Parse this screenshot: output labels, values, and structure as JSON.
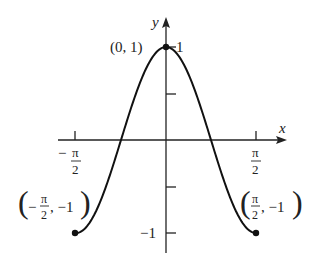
{
  "chart_data": {
    "type": "line",
    "title": "",
    "function": "y = cos(2x)",
    "xlabel": "x",
    "ylabel": "y",
    "xlim": [
      -1.5708,
      1.5708
    ],
    "ylim": [
      -1,
      1
    ],
    "grid": false,
    "x_ticks": [
      {
        "value": -1.5708,
        "label_num": "π",
        "label_den": "2",
        "sign": "−"
      },
      {
        "value": 1.5708,
        "label_num": "π",
        "label_den": "2",
        "sign": ""
      }
    ],
    "y_ticks": [
      {
        "value": 1,
        "label": "1"
      },
      {
        "value": 0.5,
        "label": ""
      },
      {
        "value": -0.5,
        "label": ""
      },
      {
        "value": -1,
        "label": "−1"
      }
    ],
    "series": [
      {
        "name": "cos(2x)",
        "x": [
          -1.5708,
          -1.1781,
          -0.7854,
          -0.3927,
          0,
          0.3927,
          0.7854,
          1.1781,
          1.5708
        ],
        "values": [
          -1,
          -0.7071,
          0,
          0.7071,
          1,
          0.7071,
          0,
          -0.7071,
          -1
        ]
      }
    ],
    "annotations": [
      {
        "point": [
          0,
          1
        ],
        "text": "(0, 1)"
      },
      {
        "point": [
          -1.5708,
          -1
        ],
        "text": "(−π/2, −1)"
      },
      {
        "point": [
          1.5708,
          -1
        ],
        "text": "(π/2, −1)"
      }
    ]
  },
  "labels": {
    "x_axis": "x",
    "y_axis": "y",
    "top_point": "(0, 1)",
    "y_one": "1",
    "y_neg_one": "−1",
    "pi": "π",
    "two": "2",
    "minus": "−",
    "left_point_tail": ", −1",
    "right_point_tail": ", −1"
  }
}
